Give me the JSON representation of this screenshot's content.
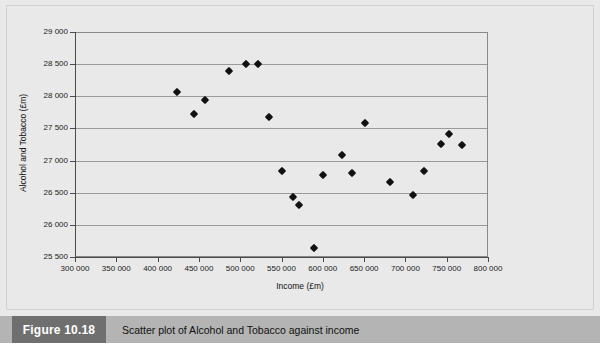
{
  "figure": {
    "tag": "Figure 10.18",
    "caption": "Scatter plot of Alcohol and Tobacco against income"
  },
  "chart_data": {
    "type": "scatter",
    "title": "",
    "xlabel": "Income (£m)",
    "ylabel": "Alcohol and Tobacco (£m)",
    "xlim": [
      300000,
      800000
    ],
    "ylim": [
      25500,
      29000
    ],
    "xticks": [
      300000,
      350000,
      400000,
      450000,
      500000,
      550000,
      600000,
      650000,
      700000,
      750000,
      800000
    ],
    "yticks": [
      25500,
      26000,
      26500,
      27000,
      27500,
      28000,
      28500,
      29000
    ],
    "xtick_labels": [
      "300 000",
      "350 000",
      "400 000",
      "450 000",
      "500 000",
      "550 000",
      "600 000",
      "650 000",
      "700 000",
      "750 000",
      "800 000"
    ],
    "ytick_labels": [
      "25 500",
      "26 000",
      "26 500",
      "27 000",
      "27 500",
      "28 000",
      "28 500",
      "29 000"
    ],
    "grid": "horizontal",
    "legend": "none",
    "marker": "diamond",
    "marker_color": "#111111",
    "series": [
      {
        "name": "Alcohol and Tobacco",
        "points": [
          [
            424000,
            28060
          ],
          [
            444000,
            27730
          ],
          [
            457000,
            27950
          ],
          [
            486000,
            28390
          ],
          [
            507000,
            28500
          ],
          [
            521000,
            28495
          ],
          [
            535000,
            27680
          ],
          [
            551000,
            26840
          ],
          [
            564000,
            26440
          ],
          [
            571000,
            26310
          ],
          [
            589000,
            25640
          ],
          [
            600000,
            26770
          ],
          [
            623000,
            27090
          ],
          [
            635000,
            26800
          ],
          [
            651000,
            27590
          ],
          [
            681000,
            26670
          ],
          [
            709000,
            26470
          ],
          [
            722000,
            26840
          ],
          [
            743000,
            27260
          ],
          [
            753000,
            27420
          ],
          [
            769000,
            27250
          ]
        ]
      }
    ]
  }
}
